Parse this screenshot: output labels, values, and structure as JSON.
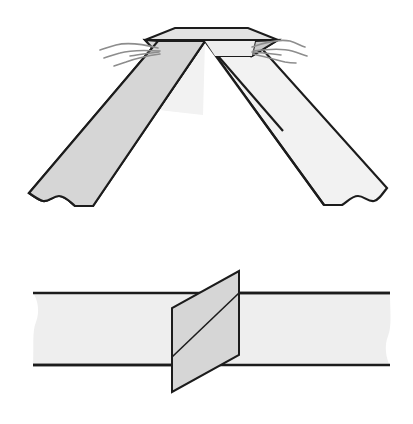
{
  "figure": {
    "title": "Two overlapping paper strips crossed and woven, shown in two views",
    "background_color": "#ffffff",
    "views": [
      {
        "id": "top-view",
        "name": "crossed-strips-apex-view",
        "description": "Two wide strips meeting at an apex forming an inverted V, woven together at the top with frayed fibers at the crossing",
        "parts": [
          {
            "id": "right-strip",
            "name": "right-descending-strip",
            "fill": "#f2f2f2",
            "stroke": "#1c1c1c",
            "stroke_width": 2.2
          },
          {
            "id": "left-strip",
            "name": "left-descending-strip",
            "fill": "#d6d6d6",
            "stroke": "#1c1c1c",
            "stroke_width": 2.2
          },
          {
            "id": "apex-flap-back",
            "name": "apex-back-flap",
            "fill": "#e2e2e2",
            "stroke": "#1c1c1c",
            "stroke_width": 2.0
          },
          {
            "id": "apex-flap-front",
            "name": "apex-front-flap",
            "fill": "#f4f4f4",
            "stroke": "#1c1c1c",
            "stroke_width": 2.0
          },
          {
            "id": "fibers-left",
            "name": "frayed-fibers-left",
            "stroke": "#8d8d8d",
            "count": 4
          },
          {
            "id": "fibers-right",
            "name": "frayed-fibers-right",
            "stroke": "#8d8d8d",
            "count": 4
          }
        ]
      },
      {
        "id": "bottom-view",
        "name": "horizontal-band-with-insert-view",
        "description": "A horizontal torn-edge band with a slanted parallelogram strip passing through it",
        "parts": [
          {
            "id": "horizontal-band",
            "name": "horizontal-band",
            "fill": "#eeeeee",
            "stroke": "#1c1c1c",
            "stroke_width": 2.4
          },
          {
            "id": "slanted-strip",
            "name": "slanted-parallelogram-strip",
            "fill": "#d6d6d6",
            "stroke": "#1c1c1c",
            "stroke_width": 2.0
          },
          {
            "id": "strip-fold-line",
            "name": "strip-fold-line",
            "stroke": "#1c1c1c",
            "stroke_width": 1.6
          }
        ]
      }
    ],
    "colors": {
      "ink": "#1c1c1c",
      "light_paper": "#f2f2f2",
      "mid_paper": "#d6d6d6",
      "band_paper": "#eeeeee",
      "fiber_gray": "#8d8d8d",
      "hairline_gray": "#7d7d7d"
    }
  }
}
